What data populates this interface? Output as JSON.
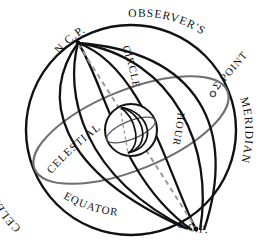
{
  "figure": {
    "name": "celestial-sphere-diagram",
    "type": "astronomical-diagram",
    "background_color": "#ffffff",
    "ink_color": "#111111",
    "secondary_ink_color": "#777777",
    "dashed_color": "#9a9a9a"
  },
  "labels": {
    "celestial_sphere": "CELESTIAL SPHERE",
    "ncp": "N.C.P.",
    "observers": "OBSERVER'S",
    "meridian": "MERIDIAN",
    "sigma_point": "Σ POINT",
    "hour": "HOUR",
    "circle": "CIRCLE",
    "celestial": "CELESTIAL",
    "equator": "EQUATOR",
    "scp": "S.C.P."
  },
  "label_text": {
    "celestial_sphere_chars": "CELESTIAL SPHERE",
    "observers_meridian_full": "OBSERVER'S MERIDIAN",
    "hour_circle_full": "HOUR CIRCLE",
    "celestial_equator_full": "CELESTIAL EQUATOR"
  },
  "elements": {
    "outer_sphere": "celestial-sphere-outline",
    "polar_axis": "dashed-polar-axis",
    "earth": "earth-globe",
    "hour_circles_count": 5
  }
}
